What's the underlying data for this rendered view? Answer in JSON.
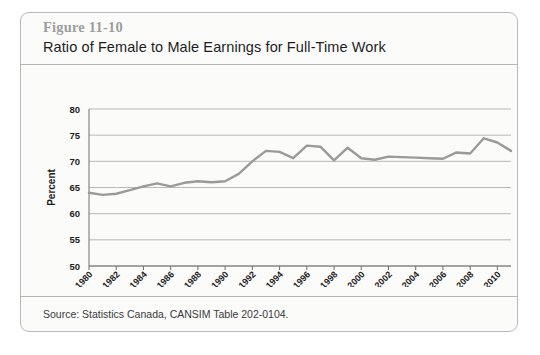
{
  "figure": {
    "number": "Figure 11-10",
    "title": "Ratio of Female to Male Earnings for Full-Time Work",
    "source": "Source: Statistics Canada, CANSIM Table 202-0104."
  },
  "colors": {
    "line": "#9a9a9a",
    "grid": "#b0b0b0",
    "axis": "#6f6f6f",
    "card_bg": "#fbfbfa",
    "card_border": "#b9b9b9",
    "fig_number": "#9e9e9e",
    "title_text": "#1d1d1d"
  },
  "chart_data": {
    "type": "line",
    "title": "Ratio of Female to Male Earnings for Full-Time Work",
    "xlabel": "",
    "ylabel": "Percent",
    "ylim": [
      50,
      80
    ],
    "yticks": [
      50,
      55,
      60,
      65,
      70,
      75,
      80
    ],
    "xlim": [
      1980,
      2011
    ],
    "xticks": [
      1980,
      1982,
      1984,
      1986,
      1988,
      1990,
      1992,
      1994,
      1996,
      1998,
      2000,
      2002,
      2004,
      2006,
      2008,
      2010
    ],
    "xtick_rotation": 45,
    "grid": true,
    "legend": false,
    "x": [
      1980,
      1981,
      1982,
      1983,
      1984,
      1985,
      1986,
      1987,
      1988,
      1989,
      1990,
      1991,
      1992,
      1993,
      1994,
      1995,
      1996,
      1997,
      1998,
      1999,
      2000,
      2001,
      2002,
      2003,
      2004,
      2005,
      2006,
      2007,
      2008,
      2009,
      2010,
      2011
    ],
    "values": [
      64.0,
      63.6,
      63.8,
      64.5,
      65.2,
      65.8,
      65.2,
      65.9,
      66.2,
      66.0,
      66.2,
      67.6,
      70.0,
      72.0,
      71.8,
      70.6,
      73.0,
      72.8,
      70.2,
      72.6,
      70.6,
      70.3,
      70.9,
      70.8,
      70.7,
      70.6,
      70.5,
      71.7,
      71.5,
      74.4,
      73.6,
      72.0
    ],
    "series_name": "Ratio of female to male earnings"
  }
}
